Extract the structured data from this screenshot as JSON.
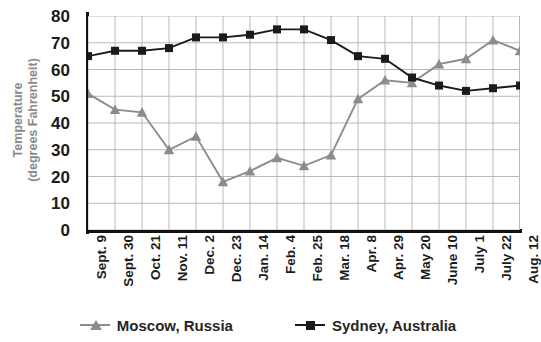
{
  "chart_data": {
    "type": "line",
    "title": "",
    "xlabel": "",
    "ylabel": "Temperature (degrees Fahrenheit)",
    "ylabel_line1": "Temperature",
    "ylabel_line2": "(degrees Fahrenheit)",
    "ylim": [
      0,
      80
    ],
    "yticks": [
      80,
      70,
      60,
      50,
      40,
      30,
      20,
      10,
      0
    ],
    "ytick_labels": [
      "80",
      "70",
      "60",
      "50",
      "40",
      "30",
      "20",
      "10",
      "0"
    ],
    "grid": true,
    "grid_color": "#b9b9b9",
    "legend_position": "bottom",
    "categories": [
      "Sept. 9",
      "Sept. 30",
      "Oct. 21",
      "Nov. 11",
      "Dec. 2",
      "Dec. 23",
      "Jan. 14",
      "Feb. 4",
      "Feb. 25",
      "Mar. 18",
      "Apr. 8",
      "Apr. 29",
      "May 20",
      "June 10",
      "July 1",
      "July 22",
      "Aug. 12"
    ],
    "series": [
      {
        "name": "Moscow, Russia",
        "color": "#8c8c8c",
        "marker": "triangle",
        "values": [
          51,
          45,
          44,
          30,
          35,
          18,
          22,
          27,
          24,
          28,
          49,
          56,
          55,
          62,
          64,
          71,
          67
        ]
      },
      {
        "name": "Sydney, Australia",
        "color": "#1b1b1b",
        "marker": "square",
        "values": [
          65,
          67,
          67,
          68,
          72,
          72,
          73,
          75,
          75,
          71,
          65,
          64,
          57,
          54,
          52,
          53,
          54
        ]
      }
    ]
  },
  "legend": {
    "items": [
      {
        "label": "Moscow, Russia",
        "marker": "triangle-marker",
        "color": "#8c8c8c"
      },
      {
        "label": "Sydney, Australia",
        "marker": "square-marker",
        "color": "#1b1b1b"
      }
    ]
  },
  "colors": {
    "moscow": "#8c8c8c",
    "sydney": "#1b1b1b",
    "axis": "#111111",
    "grid": "#b9b9b9",
    "axis_title": "#8a8a8a",
    "tick_text": "#1b1b1b",
    "background": "#ffffff"
  }
}
